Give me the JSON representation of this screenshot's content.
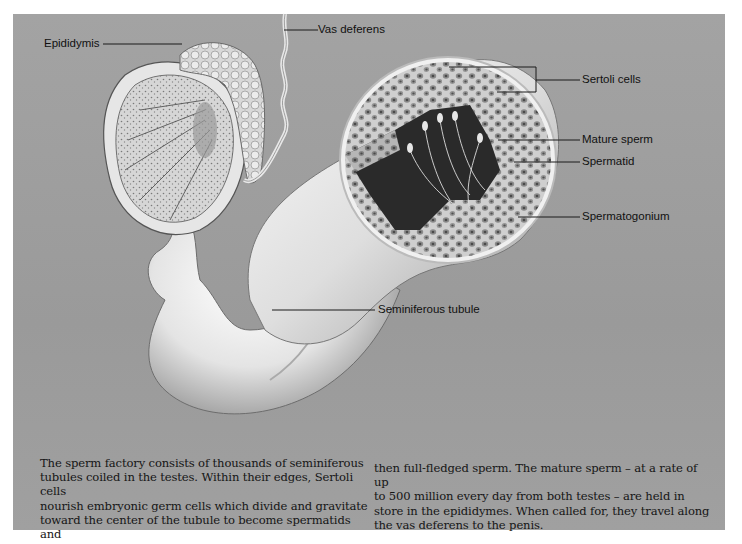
{
  "figure": {
    "background_color": "#9d9d9d",
    "labels": {
      "epididymis": "Epididymis",
      "vas_deferens": "Vas deferens",
      "sertoli_cells": "Sertoli cells",
      "mature_sperm": "Mature sperm",
      "spermatid": "Spermatid",
      "spermatogonium": "Spermatogonium",
      "seminiferous_tubule": "Seminiferous tubule"
    }
  },
  "caption": {
    "left_column": [
      "The sperm factory consists of thousands of seminiferous",
      "tubules coiled in the testes. Within their edges, Sertoli cells",
      "nourish embryonic germ cells which divide and gravitate",
      "toward the center of the tubule to become spermatids and"
    ],
    "right_column": [
      "then full-fledged sperm. The mature sperm – at a rate of up",
      "to 500 million every day from both testes – are held in",
      "store in the epididymes. When called for, they travel along",
      "the vas deferens to the penis."
    ]
  }
}
